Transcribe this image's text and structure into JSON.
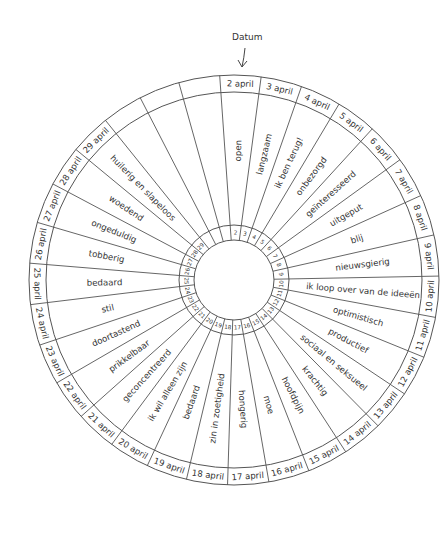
{
  "diagram": {
    "title_label": "Datum",
    "center": [
      234,
      280
    ],
    "radii": {
      "outer": 205,
      "date_inner": 188,
      "num_outer": 55,
      "hole": 40
    },
    "segment_count": 31,
    "start_angle_deg": -4,
    "colors": {
      "line": "#555555",
      "text": "#333333",
      "background": "#ffffff"
    },
    "segments": [
      {
        "date": "2 april",
        "num": "2",
        "mood": "open"
      },
      {
        "date": "3 april",
        "num": "3",
        "mood": "langzaam"
      },
      {
        "date": "4 april",
        "num": "4",
        "mood": "ik ben terug!"
      },
      {
        "date": "5 april",
        "num": "5",
        "mood": "onbezorgd"
      },
      {
        "date": "6 april",
        "num": "6",
        "mood": "geïnteresseerd"
      },
      {
        "date": "7 april",
        "num": "7",
        "mood": "uitgeput"
      },
      {
        "date": "8 april",
        "num": "8",
        "mood": "blij"
      },
      {
        "date": "9 april",
        "num": "9",
        "mood": "nieuwsgierig"
      },
      {
        "date": "10 april",
        "num": "10",
        "mood": "ik loop over van de ideeën"
      },
      {
        "date": "11 april",
        "num": "11",
        "mood": "optimistisch"
      },
      {
        "date": "12 april",
        "num": "12",
        "mood": "productief"
      },
      {
        "date": "13 april",
        "num": "13",
        "mood": "sociaal en seksueel"
      },
      {
        "date": "14 april",
        "num": "14",
        "mood": "krachtig"
      },
      {
        "date": "15 april",
        "num": "15",
        "mood": "hoofdpijn"
      },
      {
        "date": "16 april",
        "num": "16",
        "mood": "moe"
      },
      {
        "date": "17 april",
        "num": "17",
        "mood": "hongerig"
      },
      {
        "date": "18 april",
        "num": "18",
        "mood": "zin in zoetigheid"
      },
      {
        "date": "19 april",
        "num": "19",
        "mood": "bedaard"
      },
      {
        "date": "20 april",
        "num": "20",
        "mood": "ik wil alleen zijn"
      },
      {
        "date": "21 april",
        "num": "21",
        "mood": "geconcentreerd"
      },
      {
        "date": "22 april",
        "num": "22",
        "mood": "prikkelbaar"
      },
      {
        "date": "23 april",
        "num": "23",
        "mood": "doortastend"
      },
      {
        "date": "24 april",
        "num": "24",
        "mood": "stil"
      },
      {
        "date": "25 april",
        "num": "25",
        "mood": "bedaard"
      },
      {
        "date": "26 april",
        "num": "26",
        "mood": "tobberig"
      },
      {
        "date": "27 april",
        "num": "27",
        "mood": "ongeduldig"
      },
      {
        "date": "28 april",
        "num": "28",
        "mood": "woedend"
      },
      {
        "date": "29 april",
        "num": "29",
        "mood": "huilerig en slapeloos"
      },
      {
        "date": "",
        "num": "",
        "mood": ""
      },
      {
        "date": "",
        "num": "",
        "mood": ""
      },
      {
        "date": "",
        "num": "",
        "mood": ""
      }
    ]
  }
}
